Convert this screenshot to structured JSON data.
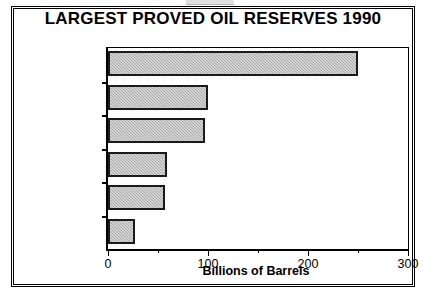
{
  "chart_data": {
    "type": "bar",
    "orientation": "horizontal",
    "title": "LARGEST PROVED OIL RESERVES 1990",
    "xlabel": "Billions of Barrels",
    "ylabel": "",
    "categories": [
      "Saudi Arabia",
      "Iraq",
      "Kuwait",
      "Soviet Union",
      "Mexico",
      "United States"
    ],
    "values": [
      250,
      100,
      97,
      59,
      57,
      27
    ],
    "xlim": [
      0,
      300
    ],
    "xticks": [
      0,
      100,
      200,
      300
    ],
    "xtick_labels": [
      "0",
      "100",
      "200",
      "300"
    ],
    "xminorticks": [
      50,
      150,
      250
    ],
    "grid": false,
    "legend": false,
    "bar_fill_color": "#b8b8b8",
    "bar_edge_color": "#1a1a1a",
    "background_color": "#ffffff",
    "text_color": "#000000"
  }
}
